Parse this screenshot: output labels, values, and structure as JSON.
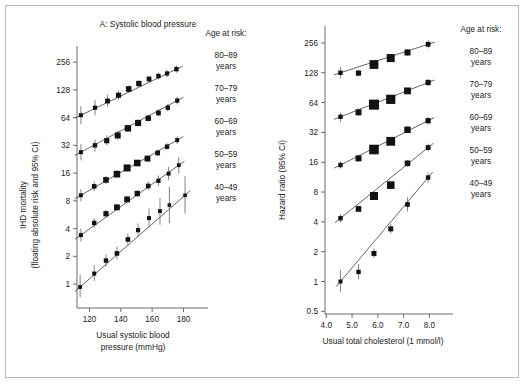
{
  "figure": {
    "width": 525,
    "height": 384,
    "background": "#ffffff",
    "border_color": "#b9b9b9",
    "ink_color": "#121212",
    "axis_color": "#5a5a5a"
  },
  "legend": {
    "heading": "Age at risk:",
    "entries": [
      {
        "range": "80–89",
        "unit": "years"
      },
      {
        "range": "70–79",
        "unit": "years"
      },
      {
        "range": "60–69",
        "unit": "years"
      },
      {
        "range": "50–59",
        "unit": "years"
      },
      {
        "range": "40–49",
        "unit": "years"
      }
    ]
  },
  "chart_data": [
    {
      "type": "scatter",
      "panel": "A",
      "title": "A: Systolic blood pressure",
      "xlabel": "Usual systolic blood pressure (mmHg)",
      "xlabel_line1": "Usual systolic blood",
      "xlabel_line2": "pressure (mmHg)",
      "ylabel": "IHD mortality (floating absolute risk and 95% CI)",
      "ylabel_line1": "IHD mortality",
      "ylabel_line2": "(floating absolute risk and 95% CI)",
      "yscale": "log2",
      "xscale": "linear",
      "grid": false,
      "legend_position": "right",
      "xlim": [
        112,
        188
      ],
      "ylim": [
        0.55,
        330
      ],
      "xticks": [
        120,
        140,
        160,
        180
      ],
      "xtick_labels": [
        "120",
        "140",
        "160",
        "180"
      ],
      "yticks": [
        1,
        2,
        4,
        8,
        16,
        32,
        64,
        128,
        256
      ],
      "ytick_labels": [
        "1",
        "2",
        "4",
        "8",
        "16",
        "32",
        "64",
        "128",
        "256"
      ],
      "series": [
        {
          "name": "80–89 years",
          "x": [
            114.5,
            123.5,
            131.5,
            138.5,
            145.0,
            151.5,
            158.0,
            164.0,
            169.5,
            175.5
          ],
          "y": [
            68.0,
            82.0,
            97.0,
            112.0,
            131.0,
            150.0,
            168.0,
            181.0,
            193.0,
            215.0
          ],
          "ci_lo": [
            54.0,
            68.0,
            84.0,
            100.0,
            120.0,
            139.0,
            155.0,
            166.0,
            176.0,
            196.0
          ],
          "ci_hi": [
            85.0,
            99.0,
            113.0,
            126.0,
            143.0,
            162.0,
            182.0,
            197.0,
            212.0,
            236.0
          ],
          "marker_sizes": [
            2.0,
            2.1,
            2.4,
            2.6,
            2.8,
            2.7,
            2.4,
            2.2,
            2.1,
            2.2
          ]
        },
        {
          "name": "70–79 years",
          "x": [
            114.5,
            123.5,
            131.0,
            138.0,
            144.5,
            151.0,
            157.5,
            164.0,
            170.0,
            176.0
          ],
          "y": [
            27.0,
            32.0,
            36.0,
            41.0,
            49.0,
            56.0,
            63.0,
            72.0,
            82.0,
            98.0
          ],
          "ci_lo": [
            22.0,
            27.5,
            32.0,
            37.0,
            45.0,
            52.0,
            58.0,
            66.0,
            75.0,
            89.0
          ],
          "ci_hi": [
            33.0,
            37.0,
            41.0,
            46.0,
            54.0,
            61.0,
            69.0,
            79.0,
            90.0,
            108.0
          ],
          "marker_sizes": [
            2.0,
            2.2,
            2.6,
            3.0,
            3.2,
            3.1,
            2.7,
            2.4,
            2.2,
            2.1
          ]
        },
        {
          "name": "60–69 years",
          "x": [
            114.5,
            123.0,
            130.5,
            137.5,
            144.0,
            150.5,
            157.0,
            163.5,
            169.5,
            176.0
          ],
          "y": [
            9.2,
            11.5,
            13.5,
            15.6,
            18.2,
            20.6,
            23.0,
            26.5,
            31.0,
            36.5
          ],
          "ci_lo": [
            7.9,
            10.2,
            12.2,
            14.3,
            16.9,
            19.2,
            21.3,
            24.5,
            28.5,
            33.2
          ],
          "ci_hi": [
            10.7,
            13.0,
            14.9,
            17.0,
            19.7,
            22.2,
            24.9,
            28.7,
            33.8,
            40.2
          ],
          "marker_sizes": [
            2.0,
            2.3,
            2.8,
            3.3,
            3.5,
            3.3,
            2.9,
            2.4,
            2.2,
            2.0
          ]
        },
        {
          "name": "50–59 years",
          "x": [
            114.5,
            123.0,
            130.5,
            137.5,
            144.0,
            150.5,
            157.5,
            164.0,
            170.5,
            177.0
          ],
          "y": [
            3.4,
            4.6,
            5.8,
            6.8,
            8.3,
            9.6,
            11.6,
            13.2,
            15.8,
            19.5
          ],
          "ci_lo": [
            2.9,
            4.1,
            5.3,
            6.3,
            7.7,
            8.9,
            10.4,
            11.6,
            13.4,
            15.9
          ],
          "ci_hi": [
            4.0,
            5.2,
            6.4,
            7.4,
            9.0,
            10.4,
            13.0,
            15.1,
            18.8,
            24.0
          ],
          "marker_sizes": [
            2.0,
            2.2,
            2.6,
            2.9,
            2.9,
            2.7,
            2.3,
            2.1,
            2.0,
            1.9
          ]
        },
        {
          "name": "40–49 years",
          "x": [
            114.0,
            123.0,
            130.5,
            137.5,
            144.5,
            151.0,
            158.0,
            165.0,
            171.0,
            181.0
          ],
          "y": [
            0.93,
            1.3,
            1.8,
            2.15,
            3.05,
            3.85,
            5.2,
            6.2,
            7.2,
            9.2
          ],
          "ci_lo": [
            0.72,
            1.08,
            1.55,
            1.85,
            2.6,
            3.25,
            4.1,
            4.4,
            4.6,
            5.8
          ],
          "ci_hi": [
            1.25,
            1.6,
            2.1,
            2.55,
            3.55,
            4.55,
            6.6,
            8.6,
            11.3,
            14.8
          ],
          "marker_sizes": [
            1.9,
            2.0,
            2.2,
            2.3,
            2.3,
            2.1,
            2.0,
            1.9,
            1.8,
            1.8
          ]
        }
      ]
    },
    {
      "type": "scatter",
      "panel": "B",
      "title": "",
      "xlabel": "Usual total cholesterol (1 mmol/l)",
      "ylabel": "Hazard ratio (95% CI)",
      "yscale": "log2",
      "xscale": "linear",
      "grid": false,
      "legend_position": "right",
      "xlim": [
        3.95,
        8.45
      ],
      "ylim": [
        0.47,
        330
      ],
      "xticks": [
        4.0,
        5.0,
        6.0,
        7.0,
        8.0
      ],
      "xtick_labels": [
        "4.0",
        "5.0",
        "6.0",
        "7.0",
        "8.0"
      ],
      "yticks": [
        0.5,
        1,
        2,
        4,
        8,
        16,
        32,
        64,
        128,
        256
      ],
      "ytick_labels": [
        "0.5",
        "1",
        "2",
        "4",
        "8",
        "16",
        "32",
        "64",
        "128",
        "256"
      ],
      "series": [
        {
          "name": "80–89 years",
          "x": [
            4.55,
            5.25,
            5.85,
            6.5,
            7.15,
            7.95
          ],
          "y": [
            128.0,
            127.0,
            155.0,
            180.0,
            205.0,
            248.0
          ],
          "ci_lo": [
            112.0,
            118.0,
            144.0,
            168.0,
            190.0,
            225.0
          ],
          "ci_hi": [
            146.0,
            137.0,
            167.0,
            193.0,
            221.0,
            272.0
          ],
          "marker_sizes": [
            2.2,
            2.6,
            4.4,
            4.0,
            3.0,
            2.4
          ]
        },
        {
          "name": "70–79 years",
          "x": [
            4.55,
            5.25,
            5.85,
            6.5,
            7.15,
            7.95
          ],
          "y": [
            46.0,
            51.0,
            61.0,
            69.0,
            84.0,
            102.0
          ],
          "ci_lo": [
            41.0,
            47.0,
            57.0,
            64.0,
            78.0,
            94.0
          ],
          "ci_hi": [
            51.0,
            56.0,
            66.0,
            75.0,
            90.0,
            111.0
          ],
          "marker_sizes": [
            2.2,
            3.0,
            5.0,
            4.6,
            3.4,
            2.6
          ]
        },
        {
          "name": "60–69 years",
          "x": [
            4.55,
            5.25,
            5.85,
            6.5,
            7.15,
            7.95
          ],
          "y": [
            15.0,
            17.5,
            21.5,
            26.0,
            34.0,
            42.0
          ],
          "ci_lo": [
            13.8,
            16.2,
            20.0,
            24.2,
            31.5,
            38.6
          ],
          "ci_hi": [
            16.3,
            19.0,
            23.2,
            28.0,
            36.7,
            45.8
          ],
          "marker_sizes": [
            2.2,
            3.0,
            4.8,
            4.4,
            3.2,
            2.6
          ]
        },
        {
          "name": "50–59 years",
          "x": [
            4.55,
            5.25,
            5.85,
            6.5,
            7.15,
            7.95
          ],
          "y": [
            4.35,
            5.4,
            7.3,
            9.4,
            15.6,
            22.5
          ],
          "ci_lo": [
            3.95,
            5.0,
            6.75,
            8.7,
            14.4,
            20.6
          ],
          "ci_hi": [
            4.8,
            5.85,
            7.9,
            10.2,
            16.9,
            24.6
          ],
          "marker_sizes": [
            2.2,
            2.8,
            4.0,
            3.8,
            2.8,
            2.4
          ]
        },
        {
          "name": "40–49 years",
          "x": [
            4.55,
            5.25,
            5.85,
            6.5,
            7.15,
            7.95
          ],
          "y": [
            1.0,
            1.25,
            1.92,
            3.4,
            6.0,
            11.2
          ],
          "ci_lo": [
            0.78,
            1.06,
            1.72,
            3.05,
            5.1,
            10.0
          ],
          "ci_hi": [
            1.3,
            1.5,
            2.16,
            3.8,
            7.1,
            12.6
          ],
          "marker_sizes": [
            2.0,
            2.2,
            2.5,
            2.5,
            2.3,
            2.2
          ]
        }
      ]
    }
  ]
}
